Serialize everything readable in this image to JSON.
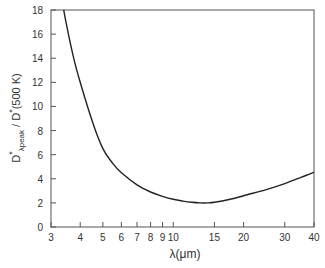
{
  "chart_data": {
    "type": "line",
    "title": "",
    "xlabel": "λ(μm)",
    "ylabel": "D*λpeak / D*(500 K)",
    "ylabel_parts": {
      "main": "D",
      "sup": "*",
      "sub": "λpeak",
      "rest": " / D",
      "rest_sup": "*",
      "tail": "(500 K)"
    },
    "xscale": "log",
    "xlim": [
      3,
      40
    ],
    "ylim": [
      0,
      18
    ],
    "grid": false,
    "legend": null,
    "x_ticks": [
      3,
      4,
      5,
      6,
      7,
      8,
      9,
      10,
      15,
      20,
      30,
      40
    ],
    "x_tick_labels": [
      "3",
      "4",
      "5",
      "6",
      "7",
      "8",
      "9",
      "10",
      "15",
      "20",
      "30",
      "40"
    ],
    "y_ticks": [
      0,
      2,
      4,
      6,
      8,
      10,
      12,
      14,
      16,
      18
    ],
    "y_tick_labels": [
      "0",
      "2",
      "4",
      "6",
      "8",
      "10",
      "12",
      "14",
      "16",
      "18"
    ],
    "series": [
      {
        "name": "D*λpeak / D*(500 K)",
        "x": [
          3.4,
          3.5,
          3.75,
          4,
          4.5,
          5,
          5.5,
          6,
          7,
          8,
          9,
          10,
          11,
          12,
          13,
          14,
          15,
          17.5,
          20,
          25,
          30,
          35,
          40
        ],
        "values": [
          18.0,
          16.7,
          14.0,
          12.0,
          8.8,
          6.5,
          5.3,
          4.5,
          3.5,
          2.9,
          2.55,
          2.3,
          2.15,
          2.05,
          2.0,
          2.0,
          2.05,
          2.3,
          2.6,
          3.1,
          3.6,
          4.1,
          4.55
        ]
      }
    ]
  }
}
